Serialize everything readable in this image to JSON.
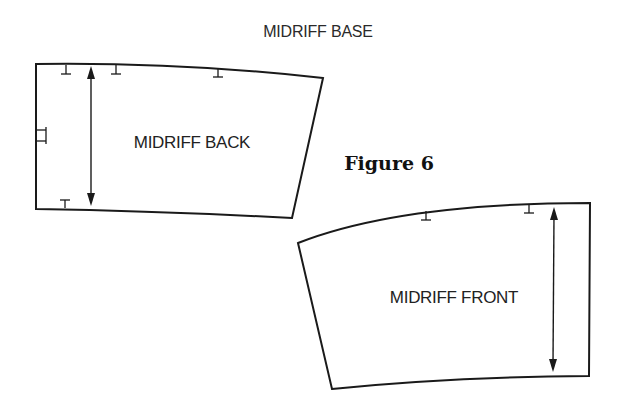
{
  "diagram": {
    "title": "MIDRIFF BASE",
    "figure_label": "Figure 6",
    "pieces": [
      {
        "name": "midriff-back",
        "label": "MIDRIFF BACK",
        "notches_top": 3,
        "notches_bottom": 1,
        "notches_side": 2,
        "grainline": "vertical, double-headed arrow near left edge"
      },
      {
        "name": "midriff-front",
        "label": "MIDRIFF FRONT",
        "notches_top": 2,
        "grainline": "vertical, double-headed arrow near right edge"
      }
    ],
    "colors": {
      "line": "#1a1a1a",
      "background": "#ffffff"
    }
  }
}
